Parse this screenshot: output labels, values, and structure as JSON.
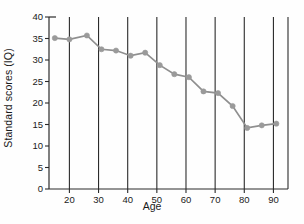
{
  "chart_data": {
    "type": "line",
    "title": "",
    "xlabel": "Age",
    "ylabel": "Standard scores (IQ)",
    "xlim": [
      13,
      95
    ],
    "ylim": [
      0,
      40
    ],
    "xticks": [
      20,
      30,
      40,
      50,
      60,
      70,
      80,
      90
    ],
    "yticks": [
      0,
      5,
      10,
      15,
      20,
      25,
      30,
      35,
      40
    ],
    "grid": "vertical gridlines at each x tick",
    "legend": "none",
    "marker": "filled circle",
    "series": [
      {
        "name": "Standard scores (IQ)",
        "color": "#8f8f8f",
        "x": [
          15,
          20,
          26,
          31,
          36,
          41,
          46,
          51,
          56,
          61,
          66,
          71,
          76,
          81,
          86,
          91
        ],
        "values": [
          35.1,
          34.8,
          35.7,
          32.5,
          32.2,
          31.0,
          31.7,
          28.8,
          26.7,
          26.0,
          22.7,
          22.3,
          19.3,
          14.2,
          14.8,
          15.2
        ]
      }
    ]
  },
  "axis": {
    "x_tick_labels": [
      "20",
      "30",
      "40",
      "50",
      "60",
      "70",
      "80",
      "90"
    ],
    "y_tick_labels": [
      "0",
      "5",
      "10",
      "15",
      "20",
      "25",
      "30",
      "35",
      "40"
    ]
  },
  "colors": {
    "line": "#8f8f8f",
    "marker": "#9a9a9a",
    "axis": "#2a2a2a",
    "gridline": "#2b2b2b",
    "background": "#fefefe"
  }
}
